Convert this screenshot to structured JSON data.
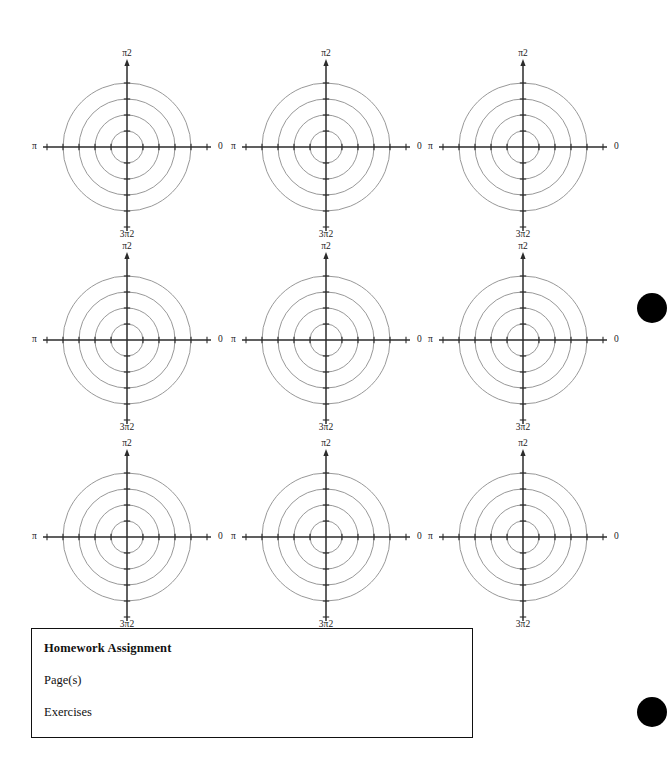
{
  "page": {
    "width": 664,
    "height": 772,
    "background": "#ffffff",
    "kind": "polar-graph-worksheet"
  },
  "grid": {
    "rows": 3,
    "columns": 3,
    "count": 9,
    "column_centers_x": [
      127,
      326,
      523
    ],
    "row_centers_y": [
      147,
      340,
      537
    ]
  },
  "polar_plot": {
    "ring_count": 4,
    "ring_radii": [
      16,
      32,
      48,
      64
    ],
    "ring_color": "#8c8c8c",
    "axis_color": "#2b2b2b",
    "axis_half_length_x": 84,
    "axis_half_length_y": 84,
    "tick_count_per_half_axis": 4,
    "labels": {
      "top": "π2",
      "right": "0",
      "bottom": "3π2",
      "left": "π"
    }
  },
  "chart_data": {
    "type": "line",
    "title": "",
    "subtitle": "",
    "xlabel": "",
    "ylabel": "",
    "grid": true,
    "legend": null,
    "panels": [
      {
        "id": "plot-1",
        "row": 1,
        "col": 1,
        "series": [],
        "angle_labels": [
          "π2",
          "0",
          "3π2",
          "π"
        ],
        "radial_ticks": [
          1,
          2,
          3,
          4
        ]
      },
      {
        "id": "plot-2",
        "row": 1,
        "col": 2,
        "series": [],
        "angle_labels": [
          "π2",
          "0",
          "3π2",
          "π"
        ],
        "radial_ticks": [
          1,
          2,
          3,
          4
        ]
      },
      {
        "id": "plot-3",
        "row": 1,
        "col": 3,
        "series": [],
        "angle_labels": [
          "π2",
          "0",
          "3π2",
          "π"
        ],
        "radial_ticks": [
          1,
          2,
          3,
          4
        ]
      },
      {
        "id": "plot-4",
        "row": 2,
        "col": 1,
        "series": [],
        "angle_labels": [
          "π2",
          "0",
          "3π2",
          "π"
        ],
        "radial_ticks": [
          1,
          2,
          3,
          4
        ]
      },
      {
        "id": "plot-5",
        "row": 2,
        "col": 2,
        "series": [],
        "angle_labels": [
          "π2",
          "0",
          "3π2",
          "π"
        ],
        "radial_ticks": [
          1,
          2,
          3,
          4
        ]
      },
      {
        "id": "plot-6",
        "row": 2,
        "col": 3,
        "series": [],
        "angle_labels": [
          "π2",
          "0",
          "3π2",
          "π"
        ],
        "radial_ticks": [
          1,
          2,
          3,
          4
        ]
      },
      {
        "id": "plot-7",
        "row": 3,
        "col": 1,
        "series": [],
        "angle_labels": [
          "π2",
          "0",
          "3π2",
          "π"
        ],
        "radial_ticks": [
          1,
          2,
          3,
          4
        ]
      },
      {
        "id": "plot-8",
        "row": 3,
        "col": 2,
        "series": [],
        "angle_labels": [
          "π2",
          "0",
          "3π2",
          "π"
        ],
        "radial_ticks": [
          1,
          2,
          3,
          4
        ]
      },
      {
        "id": "plot-9",
        "row": 3,
        "col": 3,
        "series": [],
        "angle_labels": [
          "π2",
          "0",
          "3π2",
          "π"
        ],
        "radial_ticks": [
          1,
          2,
          3,
          4
        ]
      }
    ]
  },
  "homework_box": {
    "title": "Homework Assignment",
    "pages_label": "Page(s)",
    "exercises_label": "Exercises",
    "border_color": "#111111"
  },
  "edge_marks": {
    "color": "#000000",
    "dots": [
      {
        "name": "edge-dot-upper",
        "cx": 652,
        "cy": 308,
        "r": 15
      },
      {
        "name": "edge-dot-lower",
        "cx": 652,
        "cy": 712,
        "r": 15
      }
    ]
  }
}
